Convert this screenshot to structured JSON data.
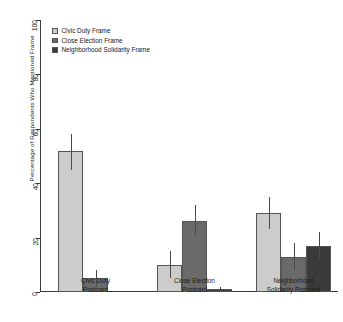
{
  "chart_data": {
    "type": "bar",
    "title": "",
    "xlabel": "",
    "ylabel": "Percentage of Respondents Who Mentioned Frame",
    "ylim": [
      0,
      100
    ],
    "yticks": [
      0,
      20,
      40,
      60,
      80,
      100
    ],
    "grid": false,
    "legend_position": "top-left",
    "categories": [
      "Civic Duty\nPostcard",
      "Close Election\nPostcard",
      "Neighborhood\nSolidarity Postcard"
    ],
    "category_lines": [
      [
        "Civic Duty",
        "Postcard"
      ],
      [
        "Close Election",
        "Postcard"
      ],
      [
        "Neighborhood",
        "Solidarity Postcard"
      ]
    ],
    "series": [
      {
        "name": "Civic Duty Frame",
        "color": "#cccccc",
        "values": [
          52,
          10,
          29
        ],
        "err_low": [
          45,
          5,
          23
        ],
        "err_high": [
          58,
          15,
          35
        ]
      },
      {
        "name": "Close Election Frame",
        "color": "#6a6a6a",
        "values": [
          5,
          26,
          13
        ],
        "err_low": [
          2,
          21,
          8
        ],
        "err_high": [
          8,
          32,
          18
        ]
      },
      {
        "name": "Neighborhood Solidarity Frame",
        "color": "#3a3a3a",
        "values": [
          0,
          1,
          17
        ],
        "err_low": [
          0,
          0,
          12
        ],
        "err_high": [
          0,
          2,
          22
        ]
      }
    ]
  },
  "axis": {
    "tick_labels": [
      "0",
      "20",
      "40",
      "60",
      "80",
      "100"
    ]
  },
  "legend": {
    "items": [
      {
        "label": "Civic Duty Frame"
      },
      {
        "label": "Close Election Frame"
      },
      {
        "label": "Neighborhood Solidarity Frame"
      }
    ]
  }
}
